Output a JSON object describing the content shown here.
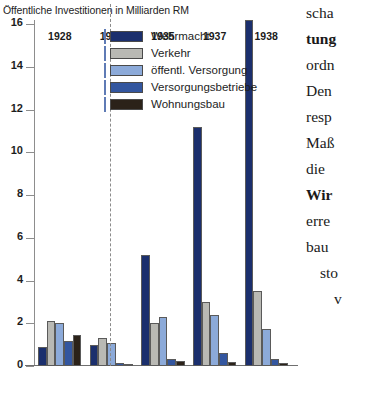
{
  "chart_data": {
    "type": "bar",
    "title": "Öffentliche Investitionen in Milliarden RM",
    "xlabel": "",
    "ylabel": "",
    "ylim": [
      0,
      16
    ],
    "yticks": [
      0,
      2,
      4,
      6,
      8,
      10,
      12,
      14,
      16
    ],
    "grid": false,
    "legend_position": "inside-top-center",
    "categories": [
      "1928",
      "1933",
      "1935",
      "1937",
      "1938"
    ],
    "series": [
      {
        "name": "Wehrmacht",
        "color": "#1b2f6d",
        "values": [
          0.9,
          1.0,
          5.2,
          11.2,
          16.2
        ]
      },
      {
        "name": "Verkehr",
        "color": "#b9b9b4",
        "values": [
          2.1,
          1.3,
          2.0,
          3.0,
          3.5
        ]
      },
      {
        "name": "öffentl. Versorgung",
        "color": "#8caad9",
        "values": [
          2.0,
          1.1,
          2.3,
          2.4,
          1.75
        ]
      },
      {
        "name": "Versorgungsbetriebe",
        "color": "#33569f",
        "values": [
          1.15,
          0.15,
          0.35,
          0.6,
          0.35
        ]
      },
      {
        "name": "Wohnungsbau",
        "color": "#2b2219",
        "values": [
          1.45,
          0.08,
          0.25,
          0.2,
          0.15
        ]
      }
    ],
    "divider_after_category": "1933",
    "annotations": []
  },
  "legend": {
    "entries": [
      {
        "label": "Wehrmacht"
      },
      {
        "label": "Verkehr"
      },
      {
        "label": "öffentl. Versorgung"
      },
      {
        "label": "Versorgungsbetriebe"
      },
      {
        "label": "Wohnungsbau"
      }
    ]
  },
  "body_text": {
    "lines": [
      {
        "text": "scha",
        "bold": false,
        "indent": 0
      },
      {
        "text": "tung",
        "bold": true,
        "indent": 0
      },
      {
        "text": "ordn",
        "bold": false,
        "indent": 0
      },
      {
        "text": "Den",
        "bold": false,
        "indent": 0
      },
      {
        "text": "resp",
        "bold": false,
        "indent": 0
      },
      {
        "text": "Maß",
        "bold": false,
        "indent": 0
      },
      {
        "text": "die",
        "bold": false,
        "indent": 0
      },
      {
        "text": "Wir",
        "bold": true,
        "indent": 0
      },
      {
        "text": "erre",
        "bold": false,
        "indent": 0
      },
      {
        "text": "bau",
        "bold": false,
        "indent": 0
      },
      {
        "text": "sto",
        "bold": false,
        "indent": 1
      },
      {
        "text": "v",
        "bold": false,
        "indent": 2
      }
    ]
  }
}
